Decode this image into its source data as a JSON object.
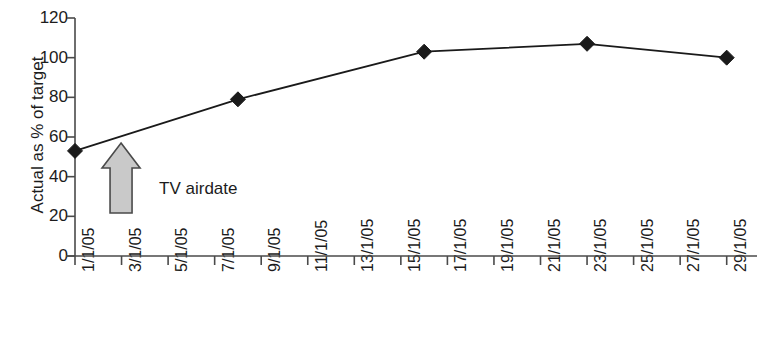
{
  "chart_data": {
    "type": "line",
    "title": "",
    "xlabel": "",
    "ylabel": "Actual as % of target",
    "ylim": [
      0,
      120
    ],
    "ytick_values": [
      0,
      20,
      40,
      60,
      80,
      100,
      120
    ],
    "ytick_labels": [
      "0",
      "20",
      "40",
      "60",
      "80",
      "100",
      "120"
    ],
    "grid": false,
    "legend": "none",
    "x_is_dates": true,
    "xtick_labels": [
      "1/1/05",
      "3/1/05",
      "5/1/05",
      "7/1/05",
      "9/1/05",
      "11/1/05",
      "13/1/05",
      "15/1/05",
      "17/1/05",
      "19/1/05",
      "21/1/05",
      "23/1/05",
      "25/1/05",
      "27/1/05",
      "29/1/05"
    ],
    "xtick_day_numbers": [
      1,
      3,
      5,
      7,
      9,
      11,
      13,
      15,
      17,
      19,
      21,
      23,
      25,
      27,
      29
    ],
    "xlim_days": [
      1,
      30
    ],
    "series": [
      {
        "name": "Actual as % of target",
        "marker": "diamond",
        "color": "#1a1a1a",
        "points": [
          {
            "x_label": "1/1/05",
            "x_day": 1,
            "y": 53
          },
          {
            "x_label": "8/1/05",
            "x_day": 8,
            "y": 79
          },
          {
            "x_label": "16/1/05",
            "x_day": 16,
            "y": 103
          },
          {
            "x_label": "23/1/05",
            "x_day": 23,
            "y": 107
          },
          {
            "x_label": "29/1/05",
            "x_day": 29,
            "y": 100
          }
        ]
      }
    ],
    "annotations": [
      {
        "name": "tv-airdate",
        "label": "TV airdate",
        "arrow": "up-block-arrow",
        "points_to_x_day": 3,
        "fill_color": "#c9c9c9",
        "stroke_color": "#4a4a4a"
      }
    ],
    "colors": {
      "axis": "#4a4a4a",
      "line": "#1a1a1a",
      "marker": "#1a1a1a",
      "text": "#1c1c1c",
      "arrow_fill": "#c9c9c9",
      "arrow_stroke": "#4a4a4a",
      "background": "#ffffff"
    }
  }
}
